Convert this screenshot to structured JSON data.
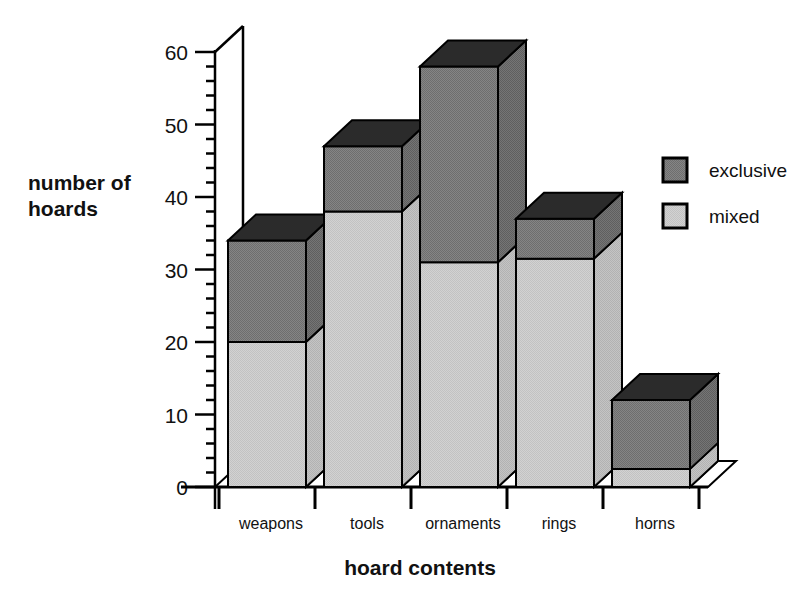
{
  "chart_data": {
    "type": "bar",
    "subtype": "stacked-3d-column",
    "title": "",
    "xlabel": "hoard contents",
    "ylabel": "number of hoards",
    "categories": [
      "weapons",
      "tools",
      "ornaments",
      "rings",
      "horns"
    ],
    "series": [
      {
        "name": "mixed",
        "values": [
          20,
          38,
          31,
          31.5,
          2.5
        ],
        "color": "#cccccc"
      },
      {
        "name": "exclusive",
        "values": [
          14,
          9,
          27,
          5.5,
          9.5
        ],
        "color": "#7d7d7d"
      }
    ],
    "stack_totals": [
      34,
      47,
      58,
      37,
      12
    ],
    "ylim": [
      0,
      60
    ],
    "ytick_labels": [
      "0",
      "10",
      "20",
      "30",
      "40",
      "50",
      "60"
    ],
    "ytick_values": [
      0,
      10,
      20,
      30,
      40,
      50,
      60
    ],
    "minor_tick_step": 2,
    "grid": false,
    "legend_position": "right",
    "legend_entries": [
      "exclusive",
      "mixed"
    ],
    "colors": {
      "exclusive": "#7d7d7d",
      "mixed": "#cccccc",
      "top_face": "#2b2b2b",
      "side_face_dark": "#6a6a6a",
      "side_face_light": "#b9b9b9",
      "outline": "#000000",
      "background": "#ffffff"
    }
  },
  "axis": {
    "y_title_line1": "number of",
    "y_title_line2": "hoards",
    "x_title": "hoard contents"
  },
  "legend": {
    "items": [
      {
        "label": "exclusive",
        "swatch": "#7d7d7d"
      },
      {
        "label": "mixed",
        "swatch": "#cccccc"
      }
    ]
  }
}
